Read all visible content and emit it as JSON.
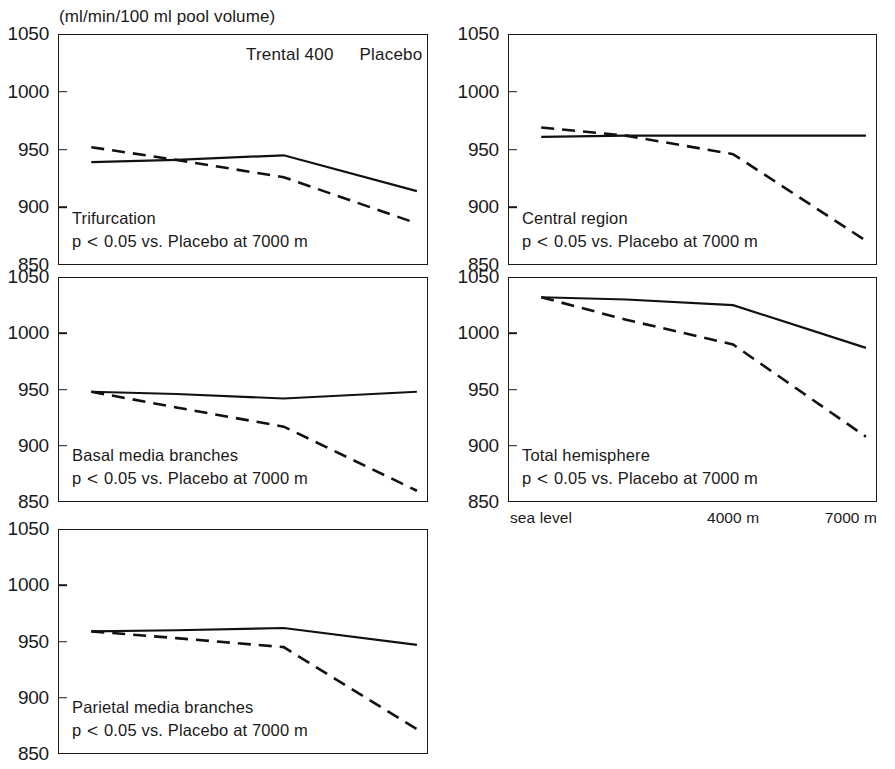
{
  "figure": {
    "units_label": "(ml/min/100 ml pool volume)",
    "legend": {
      "treatment_label": "Trental 400",
      "control_label": "Placebo"
    },
    "axis": {
      "y_ticks": [
        "1050",
        "1000",
        "950",
        "900",
        "850"
      ],
      "y_min": 850,
      "y_max": 1050,
      "x_ticks": [
        "sea level",
        "4000 m",
        "7000 m"
      ],
      "x_positions": [
        0,
        0.6,
        1.0
      ]
    },
    "significance_note": "p < 0.05 vs. Placebo at 7000 m"
  },
  "chart_data": {
    "type": "line",
    "title": "(ml/min/100 ml pool volume)",
    "xlabel": "",
    "ylabel": "ml/min/100 ml pool volume",
    "ylim": [
      850,
      1050
    ],
    "grid": false,
    "legend_position": "top-right of first panel",
    "x": [
      "sea level",
      "2000 m",
      "4000 m",
      "7000 m"
    ],
    "x_frac": [
      0.09,
      0.32,
      0.61,
      0.97
    ],
    "x_tick_labels": [
      "sea level",
      "4000 m",
      "7000 m"
    ],
    "y_ticks": [
      850,
      900,
      950,
      1000,
      1050
    ],
    "panels": [
      {
        "id": "trifurcation",
        "label": "Trifurcation",
        "note": "p < 0.05 vs. Placebo at 7000 m",
        "position": "left-column-row-1",
        "series": [
          {
            "name": "Trental 400",
            "style": "solid",
            "values": [
              939,
              941,
              945,
              914
            ]
          },
          {
            "name": "Placebo",
            "style": "dashed",
            "values": [
              952,
              941,
              926,
              886
            ]
          }
        ]
      },
      {
        "id": "central-region",
        "label": "Central region",
        "note": "p < 0.05 vs. Placebo at 7000 m",
        "position": "right-column-row-1",
        "series": [
          {
            "name": "Trental 400",
            "style": "solid",
            "values": [
              961,
              962,
              962,
              962
            ]
          },
          {
            "name": "Placebo",
            "style": "dashed",
            "values": [
              969,
              962,
              946,
              871
            ]
          }
        ]
      },
      {
        "id": "basal-media-branches",
        "label": "Basal media branches",
        "note": "p < 0.05 vs. Placebo at 7000 m",
        "position": "left-column-row-2",
        "series": [
          {
            "name": "Trental 400",
            "style": "solid",
            "values": [
              948,
              946,
              942,
              948
            ]
          },
          {
            "name": "Placebo",
            "style": "dashed",
            "values": [
              948,
              934,
              917,
              860
            ]
          }
        ]
      },
      {
        "id": "total-hemisphere",
        "label": "Total hemisphere",
        "note": "p < 0.05 vs. Placebo at 7000 m",
        "position": "right-column-row-2",
        "series": [
          {
            "name": "Trental 400",
            "style": "solid",
            "values": [
              1032,
              1030,
              1025,
              987
            ]
          },
          {
            "name": "Placebo",
            "style": "dashed",
            "values": [
              1032,
              1012,
              990,
              908
            ]
          }
        ]
      },
      {
        "id": "parietal-media-branches",
        "label": "Parietal media branches",
        "note": "p < 0.05 vs. Placebo at 7000 m",
        "position": "left-column-row-3",
        "series": [
          {
            "name": "Trental 400",
            "style": "solid",
            "values": [
              959,
              960,
              962,
              947
            ]
          },
          {
            "name": "Placebo",
            "style": "dashed",
            "values": [
              959,
              953,
              945,
              872
            ]
          }
        ]
      }
    ]
  }
}
